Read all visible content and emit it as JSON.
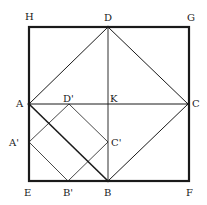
{
  "diagram": {
    "title": "",
    "colors": {
      "line": "#1a1a1a",
      "background": "#ffffff"
    },
    "points": {
      "H": {
        "x": 29,
        "y": 27,
        "label": "H"
      },
      "G": {
        "x": 189,
        "y": 27,
        "label": "G"
      },
      "E": {
        "x": 29,
        "y": 181,
        "label": "E"
      },
      "F": {
        "x": 189,
        "y": 181,
        "label": "F"
      },
      "D": {
        "x": 108,
        "y": 27,
        "label": "D"
      },
      "A": {
        "x": 29,
        "y": 104,
        "label": "A"
      },
      "K": {
        "x": 108,
        "y": 104,
        "label": "K"
      },
      "C": {
        "x": 188,
        "y": 104,
        "label": "C"
      },
      "B": {
        "x": 108,
        "y": 181,
        "label": "B"
      },
      "D_prime": {
        "x": 69,
        "y": 104,
        "label": "D'"
      },
      "C_prime": {
        "x": 108,
        "y": 142,
        "label": "C'"
      },
      "A_prime": {
        "x": 29,
        "y": 142,
        "label": "A'"
      },
      "B_prime": {
        "x": 68,
        "y": 181,
        "label": "B'"
      }
    },
    "labels": {
      "H": "H",
      "G": "G",
      "E": "E",
      "F": "F",
      "D": "D",
      "A": "A",
      "K": "K",
      "C": "C",
      "B": "B",
      "D_prime": "D'",
      "C_prime": "C'",
      "A_prime": "A'",
      "B_prime": "B'"
    },
    "segments": [
      {
        "name": "outer-square",
        "points": [
          "H",
          "G",
          "F",
          "E"
        ],
        "weight": "thick"
      },
      {
        "name": "square-ABCD",
        "points": [
          "A",
          "B",
          "C",
          "D"
        ],
        "weight": "medium"
      },
      {
        "name": "line-AC",
        "points": [
          "A",
          "C"
        ],
        "weight": "thin"
      },
      {
        "name": "line-DB",
        "points": [
          "D",
          "B"
        ],
        "weight": "thin"
      },
      {
        "name": "square-A'B'C'D'",
        "points": [
          "A_prime",
          "B_prime",
          "C_prime",
          "D_prime"
        ],
        "weight": "thin"
      }
    ]
  }
}
